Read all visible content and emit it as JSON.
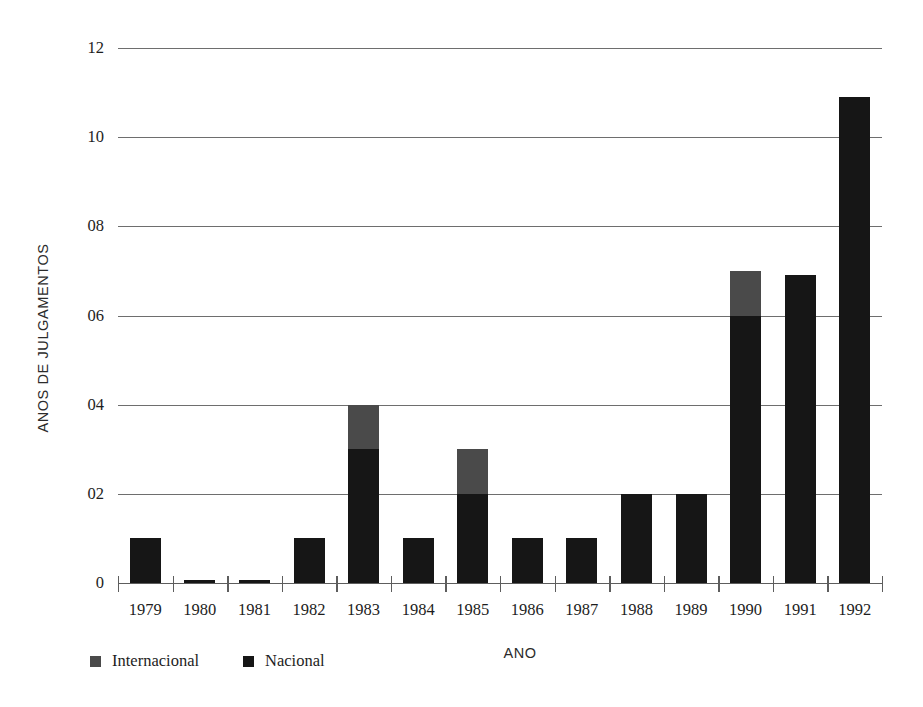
{
  "chart_data": {
    "type": "bar",
    "stacked": true,
    "title": "",
    "xlabel": "ANO",
    "ylabel": "ANOS DE JULGAMENTOS",
    "categories": [
      "1979",
      "1980",
      "1981",
      "1982",
      "1983",
      "1984",
      "1985",
      "1986",
      "1987",
      "1988",
      "1989",
      "1990",
      "1991",
      "1992"
    ],
    "series": [
      {
        "name": "Nacional",
        "color": "#161616",
        "values": [
          1,
          0.05,
          0.05,
          1,
          3,
          1,
          2,
          1,
          1,
          2,
          2,
          6,
          6.9,
          10.9
        ]
      },
      {
        "name": "Internacional",
        "color": "#4a4a4a",
        "values": [
          0,
          0,
          0,
          0,
          1,
          0,
          1,
          0,
          0,
          0,
          0,
          1,
          0,
          0
        ]
      }
    ],
    "totals": [
      1,
      0.05,
      0.05,
      1,
      4,
      1,
      3,
      1,
      1,
      2,
      2,
      7,
      6.9,
      10.9
    ],
    "ylim": [
      0,
      12
    ],
    "yticks": [
      0,
      2,
      4,
      6,
      8,
      10,
      12
    ],
    "ytick_labels": [
      "0",
      "02",
      "04",
      "06",
      "08",
      "10",
      "12"
    ],
    "grid": true,
    "legend_position": "bottom-left",
    "legend_order": [
      "Internacional",
      "Nacional"
    ]
  },
  "axes": {
    "y_title": "ANOS DE JULGAMENTOS",
    "x_title": "ANO"
  },
  "legend": {
    "items": [
      {
        "label": "Internacional",
        "color": "#4a4a4a"
      },
      {
        "label": "Nacional",
        "color": "#161616"
      }
    ]
  },
  "colors": {
    "nacional": "#161616",
    "internacional": "#4a4a4a",
    "gridline": "#6e6e6e",
    "axis": "#5d5d5d",
    "background": "#ffffff",
    "text": "#1d1d1d"
  }
}
